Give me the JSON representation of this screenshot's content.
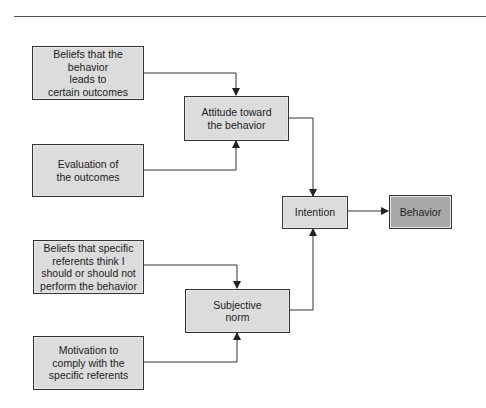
{
  "diagram": {
    "title": "",
    "nodes": {
      "beliefs_outcomes": {
        "label": "Beliefs that the\nbehavior\nleads to\ncertain outcomes"
      },
      "evaluation": {
        "label": "Evaluation of\nthe outcomes"
      },
      "attitude": {
        "label": "Attitude toward\nthe behavior"
      },
      "beliefs_referents": {
        "label": "Beliefs that specific\nreferents think I\nshould or should not\nperform the behavior"
      },
      "motivation": {
        "label": "Motivation to\ncomply with the\nspecific referents"
      },
      "subjective_norm": {
        "label": "Subjective\nnorm"
      },
      "intention": {
        "label": "Intention"
      },
      "behavior": {
        "label": "Behavior"
      }
    },
    "edges": [
      [
        "beliefs_outcomes",
        "attitude"
      ],
      [
        "evaluation",
        "attitude"
      ],
      [
        "beliefs_referents",
        "subjective_norm"
      ],
      [
        "motivation",
        "subjective_norm"
      ],
      [
        "attitude",
        "intention"
      ],
      [
        "subjective_norm",
        "intention"
      ],
      [
        "intention",
        "behavior"
      ]
    ],
    "colors": {
      "box_fill": "#dcdcdc",
      "behavior_fill": "#a9a9a9",
      "line": "#333333"
    }
  }
}
